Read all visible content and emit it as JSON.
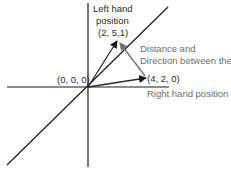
{
  "diagram": {
    "origin_label": "(0, 0, 0)",
    "left_hand": {
      "title_line1": "Left hand",
      "title_line2": "position",
      "coords": "(2, 5,1)"
    },
    "right_hand": {
      "coords": "(4, 2, 0)",
      "title": "Right hand position"
    },
    "difference": {
      "line1": "Distance and",
      "line2": "Direction between them"
    },
    "colors": {
      "axis": "#1a1a1a",
      "vector": "#2a2a2a",
      "difference_vector": "#6e6e6e"
    }
  }
}
